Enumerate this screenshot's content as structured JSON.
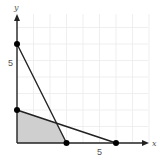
{
  "diagram": {
    "type": "feasible-region",
    "axes": {
      "x_label": "x",
      "y_label": "y",
      "x_tick_label": "5",
      "y_tick_label": "5",
      "x_range": [
        0,
        8
      ],
      "y_range": [
        0,
        7.5
      ],
      "grid": true,
      "grid_step": 1
    },
    "lines": [
      {
        "name": "line-1",
        "from": [
          0,
          6
        ],
        "to": [
          3,
          0
        ],
        "equation": "y = 6 - 2x"
      },
      {
        "name": "line-2",
        "from": [
          0,
          2
        ],
        "to": [
          6,
          0
        ],
        "equation": "y = 2 - x/3"
      }
    ],
    "points": [
      {
        "name": "y-intercept-6",
        "x": 0,
        "y": 6
      },
      {
        "name": "y-intercept-2",
        "x": 0,
        "y": 2
      },
      {
        "name": "x-intercept-3",
        "x": 3,
        "y": 0
      },
      {
        "name": "x-intercept-6",
        "x": 6,
        "y": 0
      }
    ],
    "shaded_region": [
      [
        0,
        0
      ],
      [
        0,
        2
      ],
      [
        2.4,
        1.2
      ],
      [
        3,
        0
      ]
    ],
    "colors": {
      "axis": "#222222",
      "line": "#222222",
      "grid": "#ebebeb",
      "shade": "#cfcfcf",
      "point": "#000000"
    }
  }
}
